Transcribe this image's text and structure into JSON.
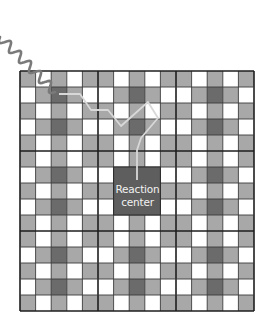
{
  "diagram": {
    "reaction_center": {
      "line1": "Reaction",
      "line2": "center"
    },
    "grid": {
      "rows": 15,
      "cols": 15,
      "origin_x": 20,
      "origin_y": 71,
      "cell_w": 15.6,
      "cell_h": 16,
      "block_size": 5,
      "row_types": [
        "A",
        "B",
        "A",
        "B",
        "A",
        "A",
        "B",
        "A",
        "B",
        "A",
        "A",
        "B",
        "A",
        "B",
        "A"
      ],
      "pattern_A": [
        "G",
        "W",
        "G",
        "W",
        "G",
        "G",
        "W",
        "G",
        "W",
        "G",
        "G",
        "W",
        "G",
        "W",
        "G"
      ],
      "pattern_B": [
        "W",
        "G",
        "D",
        "G",
        "W",
        "W",
        "G",
        "D",
        "G",
        "W",
        "W",
        "G",
        "D",
        "G",
        "W"
      ],
      "reaction_center_cells": {
        "row_start": 6,
        "row_end": 8,
        "col_start": 6,
        "col_end": 8
      }
    },
    "colors": {
      "white_cell": "#ffffff",
      "gray_cell": "#a8a8a8",
      "dark_cell": "#6b6b6b",
      "grid_line": "#3a3a3a",
      "thick_line": "#1e1e1e",
      "reaction_center": "#5e5e5e",
      "photon_wave": "#7a7a7a",
      "energy_path": "#d8d8d8"
    },
    "photon_wave": {
      "label": "incoming photon",
      "start": [
        0,
        37
      ],
      "end": [
        55,
        92
      ]
    },
    "energy_path": {
      "label": "excitation energy transfer path",
      "points": [
        [
          59,
          94
        ],
        [
          80,
          94
        ],
        [
          91,
          110
        ],
        [
          108,
          110
        ],
        [
          121,
          126
        ],
        [
          148,
          102
        ],
        [
          158,
          118
        ],
        [
          141,
          138
        ],
        [
          137,
          150
        ],
        [
          137,
          180
        ]
      ]
    }
  }
}
